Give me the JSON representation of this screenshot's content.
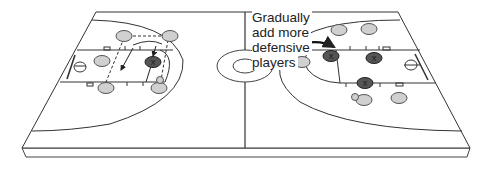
{
  "diagram": {
    "annotation": {
      "lines": [
        "Gradually",
        "add more",
        "defensive",
        "players"
      ],
      "text": "Gradually add more defensive players"
    },
    "colors": {
      "court_line": "#333333",
      "offense_player_fill": "#cfcfcf",
      "defense_player_fill": "#555555",
      "background": "#ffffff"
    },
    "left_half": {
      "offensive_players": 5,
      "defensive_players": 1,
      "marker": "X"
    },
    "right_half": {
      "offensive_players": 5,
      "defensive_players": 3,
      "marker": "X"
    }
  }
}
